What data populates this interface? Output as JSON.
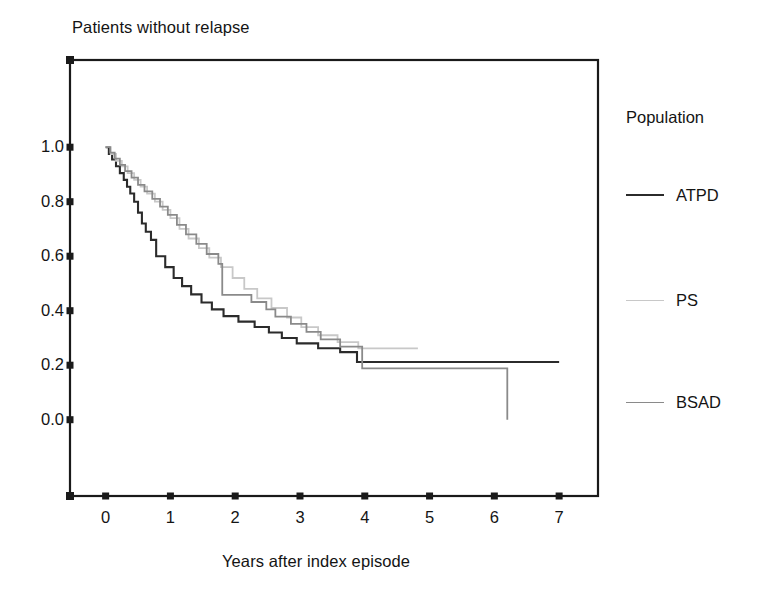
{
  "chart_data": {
    "type": "line",
    "subtype": "kaplan-meier-step",
    "title": "Patients without relapse",
    "xlabel": "Years after index episode",
    "ylabel": "",
    "xlim": [
      -0.55,
      7.6
    ],
    "ylim": [
      -0.28,
      1.32
    ],
    "xticks": [
      0,
      1,
      2,
      3,
      4,
      5,
      6,
      7
    ],
    "xtick_labels": [
      "0",
      "1",
      "2",
      "3",
      "4",
      "5",
      "6",
      "7"
    ],
    "yticks": [
      0.0,
      0.2,
      0.4,
      0.6,
      0.8,
      1.0
    ],
    "ytick_labels": [
      "0.0",
      "0.2",
      "0.4",
      "0.6",
      "0.8",
      "1.0"
    ],
    "grid": false,
    "legend_position": "right",
    "legend_title": "Population",
    "series": [
      {
        "name": "ATPD",
        "color": "#2b2b2b",
        "width": 2.1,
        "points": [
          [
            0.0,
            1.0
          ],
          [
            0.05,
            1.0
          ],
          [
            0.05,
            0.975
          ],
          [
            0.1,
            0.975
          ],
          [
            0.1,
            0.955
          ],
          [
            0.16,
            0.955
          ],
          [
            0.16,
            0.93
          ],
          [
            0.22,
            0.93
          ],
          [
            0.22,
            0.905
          ],
          [
            0.28,
            0.905
          ],
          [
            0.28,
            0.88
          ],
          [
            0.33,
            0.88
          ],
          [
            0.33,
            0.855
          ],
          [
            0.38,
            0.855
          ],
          [
            0.38,
            0.83
          ],
          [
            0.44,
            0.83
          ],
          [
            0.44,
            0.8
          ],
          [
            0.5,
            0.8
          ],
          [
            0.5,
            0.76
          ],
          [
            0.56,
            0.76
          ],
          [
            0.56,
            0.72
          ],
          [
            0.62,
            0.72
          ],
          [
            0.62,
            0.69
          ],
          [
            0.7,
            0.69
          ],
          [
            0.7,
            0.66
          ],
          [
            0.78,
            0.66
          ],
          [
            0.78,
            0.6
          ],
          [
            0.92,
            0.6
          ],
          [
            0.92,
            0.56
          ],
          [
            1.05,
            0.56
          ],
          [
            1.05,
            0.52
          ],
          [
            1.18,
            0.52
          ],
          [
            1.18,
            0.49
          ],
          [
            1.32,
            0.49
          ],
          [
            1.32,
            0.46
          ],
          [
            1.48,
            0.46
          ],
          [
            1.48,
            0.43
          ],
          [
            1.64,
            0.43
          ],
          [
            1.64,
            0.405
          ],
          [
            1.82,
            0.405
          ],
          [
            1.82,
            0.38
          ],
          [
            2.05,
            0.38
          ],
          [
            2.05,
            0.36
          ],
          [
            2.3,
            0.36
          ],
          [
            2.3,
            0.34
          ],
          [
            2.52,
            0.34
          ],
          [
            2.52,
            0.32
          ],
          [
            2.72,
            0.32
          ],
          [
            2.72,
            0.3
          ],
          [
            2.95,
            0.3
          ],
          [
            2.95,
            0.28
          ],
          [
            3.28,
            0.28
          ],
          [
            3.28,
            0.262
          ],
          [
            3.62,
            0.262
          ],
          [
            3.62,
            0.248
          ],
          [
            3.88,
            0.248
          ],
          [
            3.88,
            0.212
          ],
          [
            7.0,
            0.212
          ]
        ]
      },
      {
        "name": "PS",
        "color": "#c8c8c8",
        "width": 1.8,
        "points": [
          [
            0.0,
            1.0
          ],
          [
            0.08,
            1.0
          ],
          [
            0.08,
            0.975
          ],
          [
            0.16,
            0.975
          ],
          [
            0.16,
            0.95
          ],
          [
            0.25,
            0.95
          ],
          [
            0.25,
            0.93
          ],
          [
            0.34,
            0.93
          ],
          [
            0.34,
            0.905
          ],
          [
            0.44,
            0.905
          ],
          [
            0.44,
            0.88
          ],
          [
            0.54,
            0.88
          ],
          [
            0.54,
            0.855
          ],
          [
            0.64,
            0.855
          ],
          [
            0.64,
            0.83
          ],
          [
            0.76,
            0.83
          ],
          [
            0.76,
            0.8
          ],
          [
            0.88,
            0.8
          ],
          [
            0.88,
            0.77
          ],
          [
            1.0,
            0.77
          ],
          [
            1.0,
            0.74
          ],
          [
            1.14,
            0.74
          ],
          [
            1.14,
            0.7
          ],
          [
            1.28,
            0.7
          ],
          [
            1.28,
            0.665
          ],
          [
            1.44,
            0.665
          ],
          [
            1.44,
            0.63
          ],
          [
            1.6,
            0.63
          ],
          [
            1.6,
            0.595
          ],
          [
            1.78,
            0.595
          ],
          [
            1.78,
            0.56
          ],
          [
            1.96,
            0.56
          ],
          [
            1.96,
            0.52
          ],
          [
            2.14,
            0.52
          ],
          [
            2.14,
            0.48
          ],
          [
            2.34,
            0.48
          ],
          [
            2.34,
            0.445
          ],
          [
            2.56,
            0.445
          ],
          [
            2.56,
            0.41
          ],
          [
            2.8,
            0.41
          ],
          [
            2.8,
            0.375
          ],
          [
            3.02,
            0.375
          ],
          [
            3.02,
            0.34
          ],
          [
            3.28,
            0.34
          ],
          [
            3.28,
            0.31
          ],
          [
            3.58,
            0.31
          ],
          [
            3.58,
            0.285
          ],
          [
            3.9,
            0.285
          ],
          [
            3.9,
            0.262
          ],
          [
            4.82,
            0.262
          ]
        ]
      },
      {
        "name": "BSAD",
        "color": "#8a8a8a",
        "width": 1.8,
        "points": [
          [
            0.0,
            1.0
          ],
          [
            0.07,
            1.0
          ],
          [
            0.07,
            0.98
          ],
          [
            0.14,
            0.98
          ],
          [
            0.14,
            0.958
          ],
          [
            0.22,
            0.958
          ],
          [
            0.22,
            0.935
          ],
          [
            0.3,
            0.935
          ],
          [
            0.3,
            0.912
          ],
          [
            0.4,
            0.912
          ],
          [
            0.4,
            0.888
          ],
          [
            0.5,
            0.888
          ],
          [
            0.5,
            0.862
          ],
          [
            0.6,
            0.862
          ],
          [
            0.6,
            0.838
          ],
          [
            0.72,
            0.838
          ],
          [
            0.72,
            0.81
          ],
          [
            0.84,
            0.81
          ],
          [
            0.84,
            0.782
          ],
          [
            0.96,
            0.782
          ],
          [
            0.96,
            0.752
          ],
          [
            1.1,
            0.752
          ],
          [
            1.1,
            0.715
          ],
          [
            1.24,
            0.715
          ],
          [
            1.24,
            0.68
          ],
          [
            1.4,
            0.68
          ],
          [
            1.4,
            0.645
          ],
          [
            1.56,
            0.645
          ],
          [
            1.56,
            0.608
          ],
          [
            1.74,
            0.608
          ],
          [
            1.74,
            0.572
          ],
          [
            1.8,
            0.572
          ],
          [
            1.8,
            0.458
          ],
          [
            2.25,
            0.458
          ],
          [
            2.25,
            0.432
          ],
          [
            2.48,
            0.432
          ],
          [
            2.48,
            0.405
          ],
          [
            2.62,
            0.405
          ],
          [
            2.62,
            0.378
          ],
          [
            2.86,
            0.378
          ],
          [
            2.86,
            0.352
          ],
          [
            3.1,
            0.352
          ],
          [
            3.1,
            0.322
          ],
          [
            3.32,
            0.322
          ],
          [
            3.32,
            0.295
          ],
          [
            3.62,
            0.295
          ],
          [
            3.62,
            0.268
          ],
          [
            3.96,
            0.268
          ],
          [
            3.96,
            0.188
          ],
          [
            6.2,
            0.188
          ],
          [
            6.2,
            0.0
          ]
        ]
      }
    ],
    "annotations": [
      "ATPD curve plateaus at approximately 0.21 and is censored at year 7",
      "PS curve is censored at approximately year 4.8 at value 0.26",
      "BSAD curve drops to 0.0 at approximately year 6.2"
    ]
  },
  "legend": {
    "title": "Population",
    "entries": [
      {
        "label": "ATPD",
        "color": "#2b2b2b"
      },
      {
        "label": "PS",
        "color": "#c8c8c8"
      },
      {
        "label": "BSAD",
        "color": "#8a8a8a"
      }
    ]
  },
  "axes": {
    "frame_color": "#1a1a1a",
    "tick_color": "#1a1a1a"
  }
}
